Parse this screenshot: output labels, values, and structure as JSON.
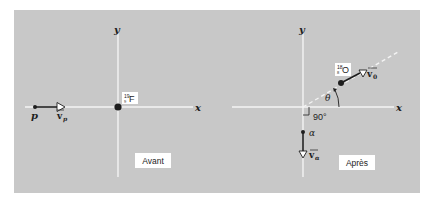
{
  "colors": {
    "panel": "#c8c8c8",
    "axis": "#f4f4f4",
    "ink": "#1e1e1e",
    "label_box": "#ffffff"
  },
  "before": {
    "caption": "Avant",
    "axis_x_label": "x",
    "axis_y_label": "y",
    "target": {
      "mass_number": "19",
      "atomic_number": "9",
      "symbol": "F"
    },
    "projectile": {
      "label": "p",
      "velocity_label": "v",
      "velocity_subscript": "p"
    }
  },
  "after": {
    "caption": "Après",
    "axis_x_label": "x",
    "axis_y_label": "y",
    "product": {
      "mass_number": "18",
      "atomic_number": "8",
      "symbol": "O",
      "velocity_label": "v",
      "velocity_subscript": "0"
    },
    "ejectile": {
      "label": "α",
      "velocity_label": "v",
      "velocity_subscript": "α"
    },
    "angle_label": "θ",
    "right_angle_label": "90°"
  }
}
